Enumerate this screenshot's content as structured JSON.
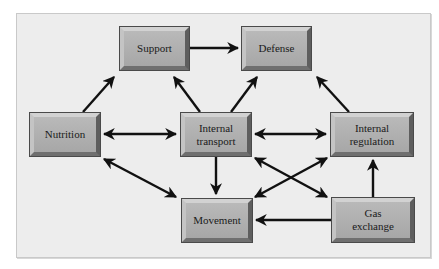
{
  "diagram": {
    "nodes": [
      {
        "id": "support",
        "label": "Support"
      },
      {
        "id": "defense",
        "label": "Defense"
      },
      {
        "id": "nutrition",
        "label": "Nutrition"
      },
      {
        "id": "internal_transport",
        "label": "Internal\ntransport"
      },
      {
        "id": "internal_regulation",
        "label": "Internal\nregulation"
      },
      {
        "id": "movement",
        "label": "Movement"
      },
      {
        "id": "gas_exchange",
        "label": "Gas\nexchange"
      }
    ],
    "edges": [
      {
        "from": "support",
        "to": "defense",
        "direction": "one-way"
      },
      {
        "from": "nutrition",
        "to": "support",
        "direction": "one-way"
      },
      {
        "from": "internal_transport",
        "to": "support",
        "direction": "one-way"
      },
      {
        "from": "internal_transport",
        "to": "defense",
        "direction": "one-way"
      },
      {
        "from": "internal_regulation",
        "to": "defense",
        "direction": "one-way"
      },
      {
        "from": "nutrition",
        "to": "internal_transport",
        "direction": "two-way"
      },
      {
        "from": "internal_transport",
        "to": "internal_regulation",
        "direction": "two-way"
      },
      {
        "from": "nutrition",
        "to": "movement",
        "direction": "two-way"
      },
      {
        "from": "internal_transport",
        "to": "movement",
        "direction": "one-way"
      },
      {
        "from": "internal_transport",
        "to": "gas_exchange",
        "direction": "two-way"
      },
      {
        "from": "movement",
        "to": "internal_regulation",
        "direction": "two-way"
      },
      {
        "from": "gas_exchange",
        "to": "movement",
        "direction": "one-way"
      },
      {
        "from": "gas_exchange",
        "to": "internal_regulation",
        "direction": "one-way"
      }
    ]
  },
  "colors": {
    "panel_background": "#ededed",
    "box_fill": "#b0b0b0",
    "arrow": "#111111"
  }
}
